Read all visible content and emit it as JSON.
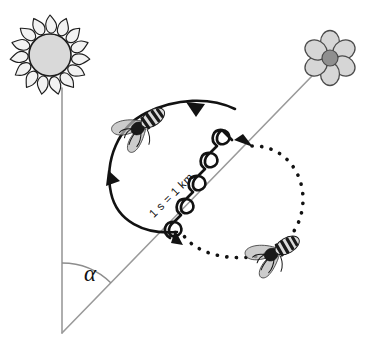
{
  "diagram": {
    "background_color": "#ffffff",
    "width": 366,
    "height": 350,
    "labels": {
      "waggle_run": "1 s = 1 km",
      "angle": "α"
    },
    "icons": {
      "sun": "sun-icon",
      "flower": "flower-icon",
      "bee_upper": "bee-icon",
      "bee_lower": "bee-icon"
    },
    "elements": [
      {
        "name": "sun-direction-line",
        "kind": "line",
        "description": "Vertical reference line from vertex up to the sun",
        "color": "#9a9a9a",
        "from": [
          62,
          333
        ],
        "to": [
          62,
          88
        ]
      },
      {
        "name": "flower-direction-line",
        "kind": "line",
        "description": "Diagonal reference line from vertex up to the flower",
        "color": "#9a9a9a",
        "from": [
          62,
          333
        ],
        "to": [
          312,
          76
        ]
      },
      {
        "name": "angle-arc",
        "kind": "arc",
        "description": "Arc marking angle alpha between sun line and flower line",
        "color": "#8d8d8d"
      },
      {
        "name": "left-loop",
        "kind": "solid-arc",
        "description": "Counter-clockwise solid return loop of the figure-eight",
        "color": "#121212"
      },
      {
        "name": "right-loop",
        "kind": "dotted-arc",
        "description": "Clockwise dotted return loop of the figure-eight",
        "color": "#121212"
      },
      {
        "name": "waggle-run",
        "kind": "wavy-line",
        "description": "Zigzag waggle run along the flower direction",
        "color": "#121212"
      }
    ],
    "colors": {
      "line_gray": "#9a9a9a",
      "ink_black": "#121212",
      "sun_disk": "#d9d9d9",
      "flower_petal": "#d6d6d6",
      "flower_center": "#8f8f8f"
    },
    "geometry": {
      "vertex": [
        62,
        333
      ],
      "sun_center": [
        50,
        55
      ],
      "flower_center": [
        330,
        58
      ],
      "angle_label_position": [
        92,
        275
      ]
    }
  }
}
